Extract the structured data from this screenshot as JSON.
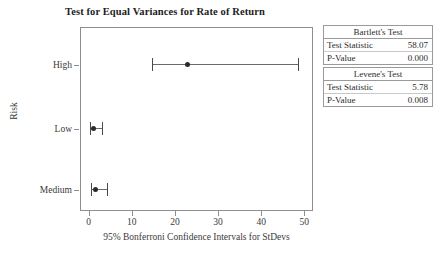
{
  "chart_data": {
    "type": "scatter",
    "title": "Test for Equal Variances for Rate of Return",
    "xlabel": "95% Bonferroni Confidence Intervals for StDevs",
    "ylabel": "Risk",
    "xlim": [
      -2,
      52
    ],
    "xticks": [
      0,
      10,
      20,
      30,
      40,
      50
    ],
    "xtick_labels": [
      "0",
      "10",
      "20",
      "30",
      "40",
      "50"
    ],
    "categories": [
      "High",
      "Low",
      "Medium"
    ],
    "grid": false,
    "legend": "none",
    "series": [
      {
        "name": "95% Bonferroni CI for StDev",
        "points": [
          {
            "category": "High",
            "stdev": 22.8,
            "lower": 14.6,
            "upper": 48.6
          },
          {
            "category": "Low",
            "stdev": 1.2,
            "lower": 0.3,
            "upper": 3.2
          },
          {
            "category": "Medium",
            "stdev": 1.6,
            "lower": 0.5,
            "upper": 4.3
          }
        ]
      }
    ]
  },
  "stats": {
    "tables": [
      {
        "title": "Bartlett's Test",
        "rows": [
          {
            "label": "Test Statistic",
            "value": "58.07"
          },
          {
            "label": "P-Value",
            "value": "0.000"
          }
        ]
      },
      {
        "title": "Levene's Test",
        "rows": [
          {
            "label": "Test Statistic",
            "value": "5.78"
          },
          {
            "label": "P-Value",
            "value": "0.008"
          }
        ]
      }
    ]
  },
  "colors": {
    "marker": "#2b2b2b",
    "interval_line": "#6b6b6b",
    "axis": "#8d8d8d",
    "text": "#3a3a3a",
    "background": "#ffffff"
  }
}
